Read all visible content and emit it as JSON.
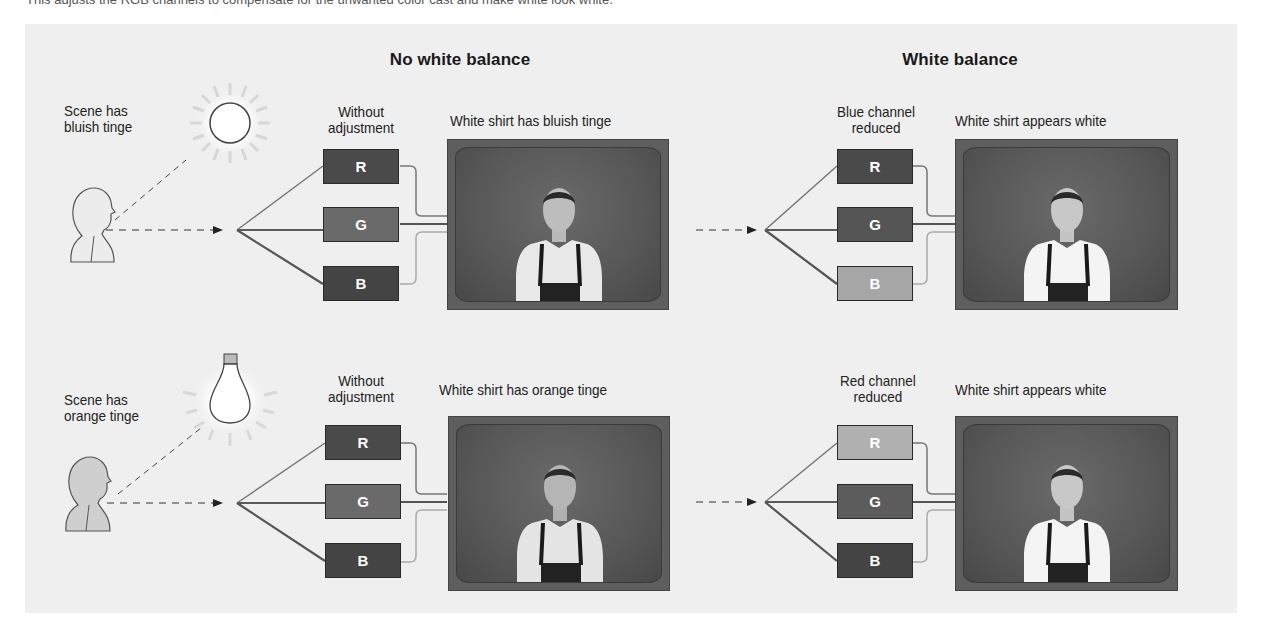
{
  "caption": "This adjusts the RGB channels to compensate for the unwanted color cast and make white look white.",
  "headings": {
    "no_wb": "No white balance",
    "wb": "White balance"
  },
  "rows": [
    {
      "scene_label_1": "Scene has",
      "scene_label_2": "bluish tinge",
      "light_source": "sun-icon",
      "left": {
        "channel_label_1": "Without",
        "channel_label_2": "adjustment",
        "tv_label": "White shirt has bluish tinge",
        "channels": [
          {
            "letter": "R",
            "shade": "#4a4a4a"
          },
          {
            "letter": "G",
            "shade": "#6a6a6a"
          },
          {
            "letter": "B",
            "shade": "#444444"
          }
        ]
      },
      "right": {
        "channel_label_1": "Blue channel",
        "channel_label_2": "reduced",
        "tv_label": "White shirt appears white",
        "channels": [
          {
            "letter": "R",
            "shade": "#4a4a4a"
          },
          {
            "letter": "G",
            "shade": "#555555"
          },
          {
            "letter": "B",
            "shade": "#a6a6a6"
          }
        ]
      }
    },
    {
      "scene_label_1": "Scene has",
      "scene_label_2": "orange tinge",
      "light_source": "lightbulb-icon",
      "left": {
        "channel_label_1": "Without",
        "channel_label_2": "adjustment",
        "tv_label": "White shirt has orange tinge",
        "channels": [
          {
            "letter": "R",
            "shade": "#4a4a4a"
          },
          {
            "letter": "G",
            "shade": "#6a6a6a"
          },
          {
            "letter": "B",
            "shade": "#444444"
          }
        ]
      },
      "right": {
        "channel_label_1": "Red channel",
        "channel_label_2": "reduced",
        "tv_label": "White shirt appears white",
        "channels": [
          {
            "letter": "R",
            "shade": "#b0b0b0"
          },
          {
            "letter": "G",
            "shade": "#5c5c5c"
          },
          {
            "letter": "B",
            "shade": "#444444"
          }
        ]
      }
    }
  ]
}
